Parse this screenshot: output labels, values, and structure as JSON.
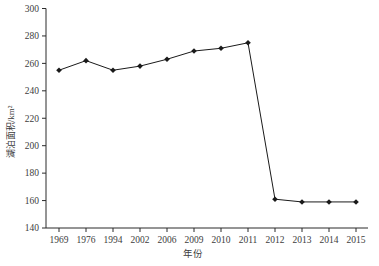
{
  "chart_data": {
    "type": "line",
    "title": "",
    "xlabel": "年份",
    "ylabel": "湖泊面积/km²",
    "categories": [
      "1969",
      "1976",
      "1994",
      "2002",
      "2006",
      "2009",
      "2010",
      "2011",
      "2012",
      "2013",
      "2014",
      "2015"
    ],
    "values": [
      255,
      262,
      255,
      258,
      263,
      269,
      271,
      275,
      161,
      159,
      159,
      159
    ],
    "ylim": [
      140,
      300
    ],
    "yticks": [
      140,
      160,
      180,
      200,
      220,
      240,
      260,
      280,
      300
    ],
    "grid": false,
    "legend": "none",
    "marker": "diamond",
    "line_color": "#1a1a1a",
    "axis_color": "#2b2b2b",
    "tick_label_color": "#3d3d3d",
    "background": "#ffffff"
  }
}
